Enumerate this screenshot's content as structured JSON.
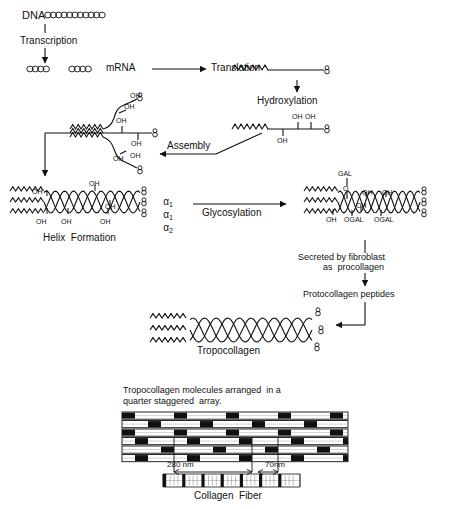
{
  "figure": {
    "ink_color": "#111111",
    "background_color": "#ffffff"
  },
  "steps": {
    "dna": "DNA",
    "transcription": "Transcription",
    "mrna": "mRNA",
    "translation": "Translation",
    "hydroxylation": "Hydroxylation",
    "assembly": "Assembly",
    "helix_formation": "Helix  Formation",
    "glycosylation": "Glycosylation",
    "secreted_line1": "Secreted by fibroblast",
    "secreted_line2": "as  procollagen",
    "protocollagen": "Protocollagen peptides",
    "tropocollagen": "Tropocollagen"
  },
  "chemical_labels": {
    "oh": "OH",
    "gal": "GAL",
    "o": "O",
    "ogal": "OGAL"
  },
  "hydroxylated_chain": {
    "oh_labels": [
      "OH",
      "OH",
      "OH"
    ]
  },
  "assembly_chain": {
    "oh_labels": [
      "OH",
      "OH",
      "OH",
      "OH",
      "OH",
      "OH",
      "OH"
    ]
  },
  "helix": {
    "oh_labels": [
      "OH",
      "OH",
      "OH",
      "OH",
      "OH",
      "OH"
    ],
    "chain_labels": [
      "α",
      "α",
      "α"
    ],
    "chain_subscripts": [
      "1",
      "1",
      "2"
    ]
  },
  "glyco_helix": {
    "top_labels": [
      "GAL",
      "O",
      "OH",
      "OH"
    ],
    "bottom_labels": [
      "OH",
      "OGAL",
      "OGAL",
      "OH"
    ]
  },
  "array_panel": {
    "caption_line1": "Tropocollagen molecules arranged  in a",
    "caption_line2": "quarter staggered  array.",
    "measure_280": "280 nm",
    "measure_70": "70nm",
    "fiber_label": "Collagen  Fiber",
    "rows": 6,
    "row_band_offsets": [
      0,
      26,
      52,
      13,
      39,
      65
    ]
  }
}
